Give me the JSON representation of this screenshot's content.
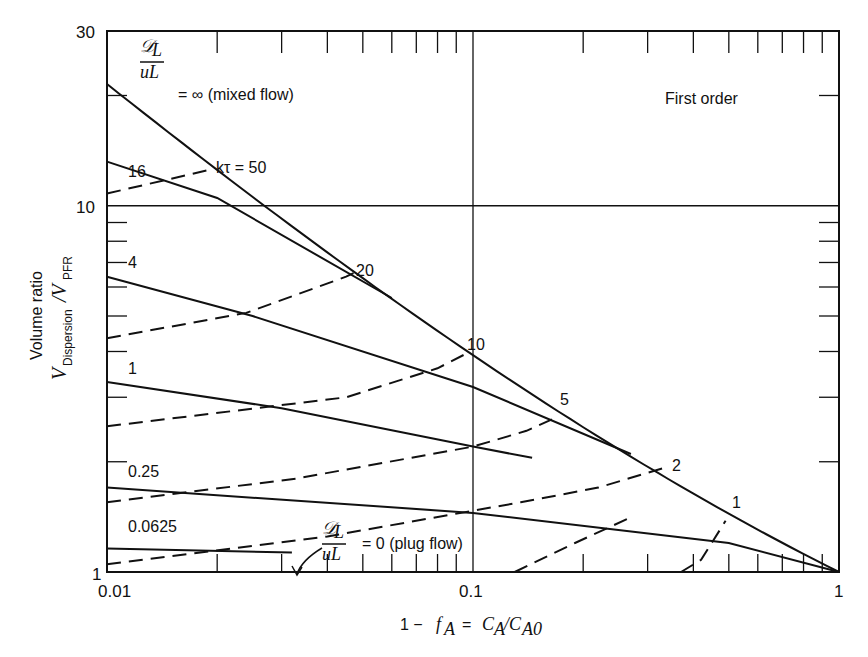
{
  "chart_data": {
    "type": "line",
    "title": "First order",
    "xlabel": "1 − f_A = C_A/C_A0",
    "ylabel": "Volume ratio V_Dispersion/V_PFR",
    "xscale": "log",
    "yscale": "log",
    "xlim": [
      0.01,
      1
    ],
    "ylim": [
      1,
      30
    ],
    "x_tick_labels": [
      "0.01",
      "0.1",
      "1"
    ],
    "y_tick_labels": [
      "1",
      "10",
      "30"
    ],
    "grid": {
      "x": [
        0.1
      ],
      "y": [
        10
      ]
    },
    "series_dispersion": [
      {
        "name": "D/uL = ∞ (mixed flow)",
        "label": "∞",
        "style": "solid",
        "points": [
          [
            0.01,
            21.5
          ],
          [
            0.02,
            17.0
          ],
          [
            0.05,
            12.4
          ],
          [
            0.1,
            3.91
          ],
          [
            0.2,
            2.49
          ],
          [
            0.5,
            1.44
          ],
          [
            1,
            1
          ]
        ]
      },
      {
        "name": "D/uL = 16",
        "label": "16",
        "style": "solid",
        "points": [
          [
            0.01,
            13.2
          ],
          [
            0.02,
            10.5
          ],
          [
            0.06,
            5.6
          ]
        ]
      },
      {
        "name": "D/uL = 4",
        "label": "4",
        "style": "solid",
        "points": [
          [
            0.01,
            6.4
          ],
          [
            0.025,
            5.0
          ],
          [
            0.1,
            3.2
          ],
          [
            0.27,
            2.1
          ]
        ]
      },
      {
        "name": "D/uL = 1",
        "label": "1",
        "style": "solid",
        "points": [
          [
            0.01,
            3.3
          ],
          [
            0.03,
            2.8
          ],
          [
            0.1,
            2.2
          ],
          [
            0.145,
            2.05
          ]
        ]
      },
      {
        "name": "D/uL = 0.25",
        "label": "0.25",
        "style": "solid",
        "points": [
          [
            0.01,
            1.7
          ],
          [
            0.1,
            1.45
          ],
          [
            0.5,
            1.2
          ],
          [
            1,
            1
          ]
        ]
      },
      {
        "name": "D/uL = 0.0625",
        "label": "0.0625",
        "style": "solid",
        "points": [
          [
            0.01,
            1.16
          ],
          [
            0.032,
            1.13
          ]
        ]
      },
      {
        "name": "D/uL = 0 (plug flow)",
        "label": "0 (plug flow)",
        "style": "axis",
        "points": [
          [
            0.01,
            1
          ],
          [
            1,
            1
          ]
        ]
      }
    ],
    "series_ktau": [
      {
        "name": "kτ = 50",
        "label": "kτ = 50",
        "style": "dashed",
        "points": [
          [
            0.01,
            10.8
          ],
          [
            0.0195,
            12.6
          ]
        ]
      },
      {
        "name": "kτ = 20",
        "label": "20",
        "style": "dashed",
        "points": [
          [
            0.01,
            4.35
          ],
          [
            0.024,
            5.1
          ],
          [
            0.045,
            6.4
          ],
          [
            0.048,
            6.6
          ]
        ]
      },
      {
        "name": "kτ = 10",
        "label": "10",
        "style": "dashed",
        "points": [
          [
            0.01,
            2.5
          ],
          [
            0.045,
            3.0
          ],
          [
            0.08,
            3.6
          ],
          [
            0.096,
            3.95
          ]
        ]
      },
      {
        "name": "kτ = 5",
        "label": "5",
        "style": "dashed",
        "points": [
          [
            0.01,
            1.55
          ],
          [
            0.033,
            1.8
          ],
          [
            0.1,
            2.2
          ],
          [
            0.14,
            2.43
          ],
          [
            0.17,
            2.65
          ]
        ]
      },
      {
        "name": "kτ = 2",
        "label": "2",
        "style": "dashed",
        "points": [
          [
            0.01,
            1.05
          ],
          [
            0.04,
            1.25
          ],
          [
            0.135,
            1.55
          ],
          [
            0.22,
            1.7
          ],
          [
            0.33,
            1.92
          ]
        ]
      },
      {
        "name": "kτ = 1",
        "label": "1",
        "style": "dashed",
        "points": [
          [
            0.13,
            1.0
          ],
          [
            0.19,
            1.2
          ],
          [
            0.27,
            1.41
          ]
        ]
      },
      {
        "name": "kτ = 1",
        "label": "1",
        "style": "dashed",
        "points": [
          [
            0.37,
            1.0
          ],
          [
            0.42,
            1.08
          ],
          [
            0.49,
            1.38
          ]
        ]
      }
    ],
    "annotations": {
      "mixed_flow": "= ∞ (mixed flow)",
      "plug_flow": "= 0 (plug flow)",
      "frac_num": "𝒟L",
      "frac_den": "uL",
      "ktau50": "kτ = 50",
      "first_order": "First order",
      "d16": "16",
      "d4": "4",
      "d1": "1",
      "d025": "0.25",
      "d00625": "0.0625",
      "k20": "20",
      "k10": "10",
      "k5": "5",
      "k2": "2",
      "k1": "1"
    }
  }
}
